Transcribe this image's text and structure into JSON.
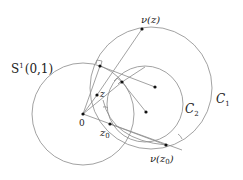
{
  "labels": {
    "s1": "S",
    "s1_sup": "1",
    "s1_args": "(0,1)",
    "c1": "C",
    "c1_sub": "1",
    "c2": "C",
    "c2_sub": "2",
    "origin": "0",
    "z": "z",
    "z0": "z",
    "z0_sub": "0",
    "nu_z": "ν(z)",
    "nu_z0": "ν(z",
    "nu_z0_sub": "0",
    "nu_z0_close": ")"
  },
  "colors": {
    "stroke": "#8a8a8a",
    "point": "#111111",
    "text": "#222222"
  }
}
